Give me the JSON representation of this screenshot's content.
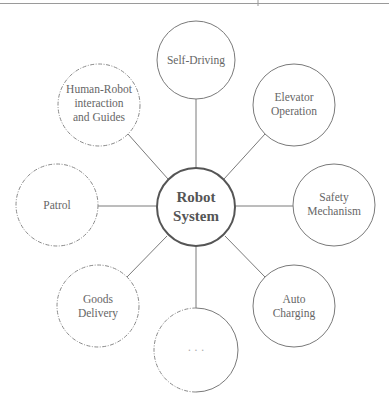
{
  "diagram": {
    "type": "hub-and-spoke",
    "center": {
      "label_line1": "Robot",
      "label_line2": "System",
      "cx": 196,
      "cy": 207,
      "r": 39
    },
    "nodes": [
      {
        "id": "self-driving",
        "lines": [
          "Self-Driving"
        ],
        "style": "solid",
        "cx": 196,
        "cy": 60,
        "r": 39
      },
      {
        "id": "elevator-operation",
        "lines": [
          "Elevator",
          "Operation"
        ],
        "style": "solid",
        "cx": 294,
        "cy": 105,
        "r": 41
      },
      {
        "id": "safety-mechanism",
        "lines": [
          "Safety",
          "Mechanism"
        ],
        "style": "solid",
        "cx": 334,
        "cy": 205,
        "r": 41
      },
      {
        "id": "auto-charging",
        "lines": [
          "Auto",
          "Charging"
        ],
        "style": "solid",
        "cx": 294,
        "cy": 306,
        "r": 41
      },
      {
        "id": "more",
        "lines": [
          "..."
        ],
        "style": "half-dashed",
        "cx": 196,
        "cy": 350,
        "r": 42
      },
      {
        "id": "goods-delivery",
        "lines": [
          "Goods",
          "Delivery"
        ],
        "style": "dashed",
        "cx": 98,
        "cy": 306,
        "r": 41
      },
      {
        "id": "patrol",
        "lines": [
          "Patrol"
        ],
        "style": "dashed",
        "cx": 57,
        "cy": 205,
        "r": 41
      },
      {
        "id": "human-robot",
        "lines": [
          "Human-Robot",
          "interaction",
          "and Guides"
        ],
        "style": "dashed",
        "cx": 99,
        "cy": 105,
        "r": 41
      }
    ],
    "labels": {
      "self_driving": "Self-Driving",
      "elevator_1": "Elevator",
      "elevator_2": "Operation",
      "safety_1": "Safety",
      "safety_2": "Mechanism",
      "auto_1": "Auto",
      "auto_2": "Charging",
      "more": "· · ·",
      "goods_1": "Goods",
      "goods_2": "Delivery",
      "patrol": "Patrol",
      "hri_1": "Human-Robot",
      "hri_2": "interaction",
      "hri_3": "and Guides",
      "center_1": "Robot",
      "center_2": "System"
    },
    "colors": {
      "line": "#7a7a7a",
      "center_stroke": "#555555",
      "text": "#666666"
    }
  }
}
